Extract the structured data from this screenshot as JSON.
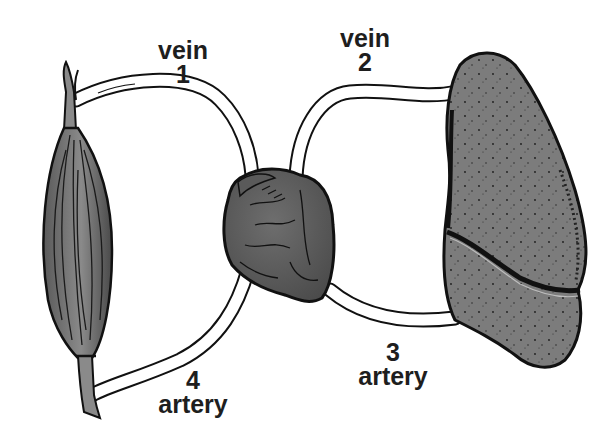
{
  "diagram": {
    "type": "circulatory-loop-illustration",
    "organs": [
      {
        "id": "muscle",
        "position": "left"
      },
      {
        "id": "heart",
        "position": "center"
      },
      {
        "id": "lung",
        "position": "right"
      }
    ],
    "labels": {
      "vein_1": {
        "word": "vein",
        "number": "1"
      },
      "vein_2": {
        "word": "vein",
        "number": "2"
      },
      "artery_3": {
        "number": "3",
        "word": "artery"
      },
      "artery_4": {
        "number": "4",
        "word": "artery"
      }
    },
    "vessels": [
      {
        "id": "1",
        "type": "vein",
        "from": "muscle",
        "to": "heart"
      },
      {
        "id": "2",
        "type": "vein",
        "from": "lung",
        "to": "heart"
      },
      {
        "id": "3",
        "type": "artery",
        "from": "heart",
        "to": "lung"
      },
      {
        "id": "4",
        "type": "artery",
        "from": "heart",
        "to": "muscle"
      }
    ],
    "colors": {
      "background": "#ffffff",
      "outline": "#111111",
      "organ_fill": "#6e6e6e",
      "lung_fill": "#7a7a7a",
      "vessel_fill": "#ffffff",
      "text": "#1e1e1e"
    }
  }
}
